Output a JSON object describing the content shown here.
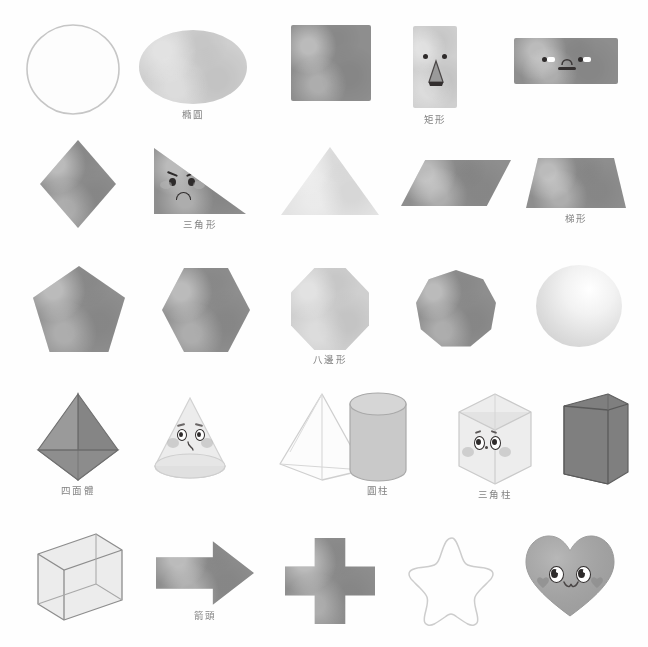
{
  "page": {
    "background_color": "#fefefe",
    "rows": 5,
    "columns": 5,
    "ink_color": "#6d6d6d"
  },
  "palette": {
    "mid_gray": "#8e8e8e",
    "light_gray": "#cfcfcf",
    "very_light_gray": "#e3e3e3",
    "dark_gray": "#7f7f7f",
    "outline": "#b9b9b9",
    "face_ink": "#2e2b2b",
    "blush": "#b4b4b4"
  },
  "shapes": [
    {
      "id": "circle",
      "icon": "circle-outline-shape",
      "label": "",
      "row": 1,
      "col": 1,
      "has_face": false,
      "fill": "outline"
    },
    {
      "id": "ellipse",
      "icon": "ellipse-shape",
      "label": "橢圓",
      "row": 1,
      "col": 2,
      "has_face": false,
      "fill": "light"
    },
    {
      "id": "square",
      "icon": "square-shape",
      "label": "",
      "row": 1,
      "col": 3,
      "has_face": false,
      "fill": "mid"
    },
    {
      "id": "rectangle-tall",
      "icon": "tall-rectangle-shape",
      "label": "矩形",
      "row": 1,
      "col": 4,
      "has_face": true,
      "fill": "light",
      "face": "two-dot-eyes-with-triangle-nose"
    },
    {
      "id": "rectangle-wide",
      "icon": "wide-rectangle-shape",
      "label": "",
      "row": 1,
      "col": 5,
      "has_face": true,
      "fill": "mid",
      "face": "sideways-eyes-with-arch-nose-and-flat-mouth"
    },
    {
      "id": "rhombus",
      "icon": "rhombus-shape",
      "label": "",
      "row": 2,
      "col": 1,
      "has_face": false,
      "fill": "mid"
    },
    {
      "id": "right-triangle",
      "icon": "right-triangle-shape",
      "label": "三角形",
      "row": 2,
      "col": 2,
      "has_face": true,
      "fill": "mid",
      "face": "angry-brows-with-frown"
    },
    {
      "id": "triangle",
      "icon": "equilateral-triangle-shape",
      "label": "",
      "row": 2,
      "col": 3,
      "has_face": false,
      "fill": "verylight"
    },
    {
      "id": "parallelogram",
      "icon": "parallelogram-shape",
      "label": "",
      "row": 2,
      "col": 4,
      "has_face": false,
      "fill": "mid"
    },
    {
      "id": "trapezoid",
      "icon": "trapezoid-shape",
      "label": "梯形",
      "row": 2,
      "col": 5,
      "has_face": false,
      "fill": "mid"
    },
    {
      "id": "pentagon",
      "icon": "pentagon-shape",
      "label": "",
      "row": 3,
      "col": 1,
      "has_face": false,
      "fill": "mid"
    },
    {
      "id": "hexagon",
      "icon": "hexagon-shape",
      "label": "",
      "row": 3,
      "col": 2,
      "has_face": false,
      "fill": "mid"
    },
    {
      "id": "octagon",
      "icon": "octagon-shape",
      "label": "八邊形",
      "row": 3,
      "col": 3,
      "has_face": false,
      "fill": "light"
    },
    {
      "id": "nonagon",
      "icon": "nonagon-shape",
      "label": "",
      "row": 3,
      "col": 4,
      "has_face": false,
      "fill": "mid"
    },
    {
      "id": "sphere",
      "icon": "sphere-shape",
      "label": "",
      "row": 3,
      "col": 5,
      "has_face": false,
      "fill": "verylight"
    },
    {
      "id": "tetrahedron",
      "icon": "tetrahedron-shape",
      "label": "四面體",
      "row": 4,
      "col": 1,
      "has_face": false,
      "fill": "mid"
    },
    {
      "id": "cone",
      "icon": "cone-shape",
      "label": "",
      "row": 4,
      "col": 2,
      "has_face": true,
      "fill": "verylight",
      "face": "worried-eyes-with-blush"
    },
    {
      "id": "pyramid",
      "icon": "pyramid-outline-shape",
      "label": "",
      "row": 4,
      "col": 3,
      "has_face": false,
      "fill": "outline"
    },
    {
      "id": "cylinder",
      "icon": "cylinder-shape",
      "label": "圓柱",
      "row": 4,
      "col": 4,
      "has_face": false,
      "fill": "light"
    },
    {
      "id": "triangular-prism",
      "icon": "triangular-prism-shape",
      "label": "三角柱",
      "row": 4,
      "col": 5,
      "has_face": true,
      "fill": "verylight",
      "face": "surprised-eyes-with-blush"
    },
    {
      "id": "cuboid",
      "icon": "cuboid-shape",
      "label": "",
      "row": 4,
      "col": 6,
      "has_face": false,
      "fill": "dark"
    },
    {
      "id": "cube",
      "icon": "cube-wireframe-shape",
      "label": "",
      "row": 5,
      "col": 1,
      "has_face": false,
      "fill": "verylight"
    },
    {
      "id": "arrow",
      "icon": "right-arrow-shape",
      "label": "箭頭",
      "row": 5,
      "col": 2,
      "has_face": false,
      "fill": "mid"
    },
    {
      "id": "cross",
      "icon": "cross-plus-shape",
      "label": "",
      "row": 5,
      "col": 3,
      "has_face": false,
      "fill": "mid"
    },
    {
      "id": "star",
      "icon": "star-outline-shape",
      "label": "",
      "row": 5,
      "col": 4,
      "has_face": false,
      "fill": "outline"
    },
    {
      "id": "heart",
      "icon": "heart-shape",
      "label": "",
      "row": 5,
      "col": 5,
      "has_face": true,
      "fill": "mid",
      "face": "happy-eyes-with-heart-blush-and-smile"
    }
  ]
}
